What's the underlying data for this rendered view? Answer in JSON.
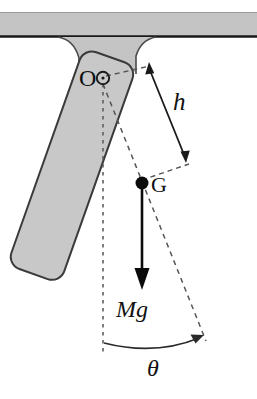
{
  "figure": {
    "background_color": "#ffffff"
  },
  "ceiling": {
    "label": "ceiling-support",
    "fill_color": "#c4c4c4",
    "edge_color": "#1a1a1a"
  },
  "bracket": {
    "label": "mounting-bracket",
    "fill_color": "#c4c4c4",
    "edge_color": "#4a4a4a"
  },
  "rod": {
    "label": "pendulum-rod",
    "fill_color": "#c8c8c8",
    "edge_color": "#3a3a3a"
  },
  "labels": {
    "pivot": "O",
    "center_of_gravity": "G",
    "distance": "h",
    "weight": "Mg",
    "angle": "θ"
  },
  "annotations": {
    "pivot_marker": "small-open-circle",
    "cg_marker": "filled-black-dot",
    "weight_arrow": "downward-arrow",
    "distance_arrow": "double-headed-arrow",
    "angle_arc": "curved-arrow-with-arrowhead",
    "vertical_reference": "dashed-vertical-line",
    "rod_axis": "dashed-rod-centerline"
  },
  "colors": {
    "ink": "#111111",
    "dash": "#555555",
    "gray_fill": "#c8c8c8",
    "outline": "#3a3a3a"
  }
}
